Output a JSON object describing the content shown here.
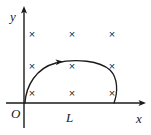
{
  "figure": {
    "type": "physics-diagram",
    "background_color": "#ffffff",
    "ink_color": "#1a1a1a",
    "axes": {
      "x_label": "x",
      "y_label": "y",
      "origin_label": "O",
      "x_axis_y": 103,
      "y_axis_x": 24,
      "x_axis_start": 6,
      "x_axis_end": 145,
      "y_axis_top": 7,
      "y_axis_bottom": 128
    },
    "length_label": "L",
    "length_label_x": 70,
    "length_label_y": 118,
    "field": {
      "symbol": "×",
      "meaning": "magnetic-field-into-page",
      "columns_x": [
        32,
        72,
        112
      ],
      "rows_y": [
        35,
        67,
        94
      ],
      "markers": [
        {
          "x": 32,
          "y": 35
        },
        {
          "x": 72,
          "y": 35
        },
        {
          "x": 112,
          "y": 35
        },
        {
          "x": 32,
          "y": 67
        },
        {
          "x": 72,
          "y": 67
        },
        {
          "x": 112,
          "y": 67
        },
        {
          "x": 32,
          "y": 94
        },
        {
          "x": 72,
          "y": 94
        },
        {
          "x": 112,
          "y": 94
        }
      ]
    },
    "curve": {
      "name": "current-loop",
      "path": "M 25 103 C 26 86, 36 68, 56 63 C 76 58, 100 61, 110 70 C 118 78, 118 92, 114 103",
      "direction_arrow": {
        "x": 60,
        "y": 62.2,
        "angle": -9,
        "label": "current-direction"
      }
    }
  }
}
